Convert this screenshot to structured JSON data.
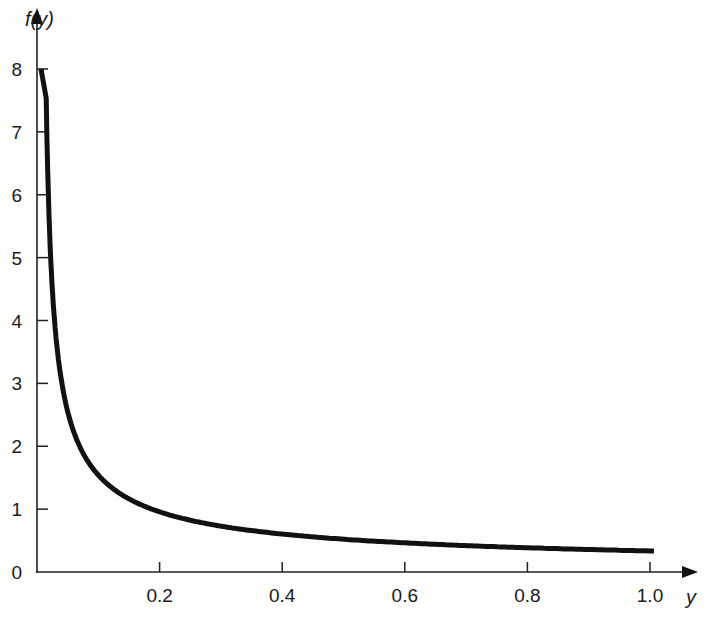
{
  "chart_data": {
    "type": "line",
    "title": "",
    "xlabel": "y",
    "ylabel": "f(y)",
    "xlim": [
      0,
      1.0
    ],
    "ylim": [
      0,
      8
    ],
    "grid": false,
    "legend": null,
    "x_ticks": [
      "0.2",
      "0.4",
      "0.6",
      "0.8",
      "1.0"
    ],
    "y_ticks": [
      "0",
      "1",
      "2",
      "3",
      "4",
      "5",
      "6",
      "7",
      "8"
    ],
    "series": [
      {
        "name": "f(y)",
        "function": "f(y) = (1/3) y^(-2/3)",
        "x": [
          0.0147,
          0.02,
          0.03,
          0.05,
          0.08,
          0.1,
          0.15,
          0.2,
          0.3,
          0.4,
          0.5,
          0.6,
          0.7,
          0.8,
          0.9,
          1.0
        ],
        "values": [
          8.0,
          4.5,
          3.45,
          2.46,
          1.79,
          1.55,
          1.18,
          0.95,
          0.75,
          0.6,
          0.52,
          0.45,
          0.4,
          0.36,
          0.34,
          0.32
        ]
      }
    ]
  }
}
